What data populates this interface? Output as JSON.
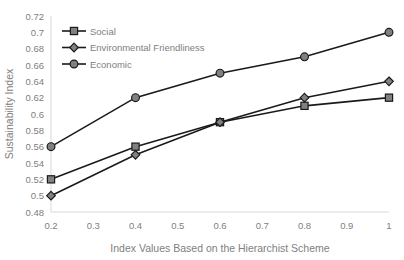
{
  "chart_data": {
    "type": "line",
    "title": "",
    "xlabel": "Index Values Based on the Hierarchist Scheme",
    "ylabel": "Sustainability Index",
    "x": [
      0.2,
      0.4,
      0.6,
      0.8,
      1
    ],
    "xlim": [
      0.2,
      1
    ],
    "ylim": [
      0.48,
      0.72
    ],
    "xticks": [
      "0.2",
      "0.3",
      "0.4",
      "0.5",
      "0.6",
      "0.7",
      "0.8",
      "0.9",
      "1"
    ],
    "xtick_values": [
      0.2,
      0.3,
      0.4,
      0.5,
      0.6,
      0.7,
      0.8,
      0.9,
      1
    ],
    "yticks": [
      "0.48",
      "0.5",
      "0.52",
      "0.54",
      "0.56",
      "0.58",
      "0.6",
      "0.62",
      "0.64",
      "0.66",
      "0.68",
      "0.7",
      "0.72"
    ],
    "ytick_values": [
      0.48,
      0.5,
      0.52,
      0.54,
      0.56,
      0.58,
      0.6,
      0.62,
      0.64,
      0.66,
      0.68,
      0.7,
      0.72
    ],
    "grid": false,
    "legend_position": "top-left-inside",
    "series": [
      {
        "name": "Social",
        "marker": "square",
        "color": "#1a1a1a",
        "marker_fill": "#808080",
        "values": [
          0.52,
          0.56,
          0.59,
          0.61,
          0.62
        ]
      },
      {
        "name": "Environmental Friendliness",
        "marker": "diamond",
        "color": "#1a1a1a",
        "marker_fill": "#808080",
        "values": [
          0.5,
          0.55,
          0.59,
          0.62,
          0.64
        ]
      },
      {
        "name": "Economic",
        "marker": "circle",
        "color": "#1a1a1a",
        "marker_fill": "#808080",
        "values": [
          0.56,
          0.62,
          0.65,
          0.67,
          0.7
        ]
      }
    ]
  },
  "legend": {
    "items": [
      {
        "label": "Social"
      },
      {
        "label": "Environmental Friendliness"
      },
      {
        "label": "Economic"
      }
    ]
  },
  "axes": {
    "x_title": "Index Values Based on the Hierarchist Scheme",
    "y_title": "Sustainability Index"
  },
  "colors": {
    "line": "#1a1a1a",
    "marker_fill": "#808080",
    "text": "#808080",
    "axis": "#d9d9d9",
    "background": "#ffffff"
  }
}
